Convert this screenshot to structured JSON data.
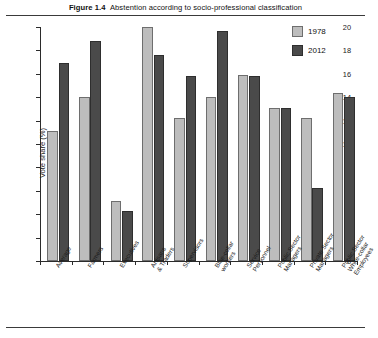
{
  "figure": {
    "number": "Figure 1.4",
    "title": "Abstention according to socio-professional classification"
  },
  "legend": {
    "position": "top-right",
    "entries": [
      {
        "label": "1978",
        "color": "#bdbdbd"
      },
      {
        "label": "2012",
        "color": "#4a4a4a"
      }
    ]
  },
  "axis": {
    "y_label": "Vote share (%)",
    "y_ticks": [
      "0",
      "2",
      "4",
      "6",
      "8",
      "10",
      "12",
      "14",
      "16",
      "18",
      "20"
    ]
  },
  "chart_data": {
    "type": "bar",
    "xlabel": "",
    "ylabel": "Vote share (%)",
    "ylim": [
      0,
      20
    ],
    "ytick_step": 2,
    "grid": false,
    "legend_position": "top-right",
    "categories": [
      "Average",
      "Farmers",
      "Executives",
      "Artisans\n& Traders",
      "Supervisors",
      "Blue-collar\nworkers",
      "Service\nPersonnel",
      "Public Sector\nManagers",
      "Private Sector\nManagers",
      "Public Sector\nWhite-collar\nEmployees"
    ],
    "series": [
      {
        "name": "1978",
        "color": "#bdbdbd",
        "values": [
          11.1,
          14.0,
          5.1,
          20.0,
          12.2,
          14.0,
          15.9,
          13.1,
          12.2,
          14.4
        ]
      },
      {
        "name": "2012",
        "color": "#4a4a4a",
        "values": [
          16.9,
          18.8,
          4.3,
          17.6,
          15.8,
          19.7,
          15.8,
          13.1,
          6.2,
          14.0
        ]
      }
    ]
  }
}
